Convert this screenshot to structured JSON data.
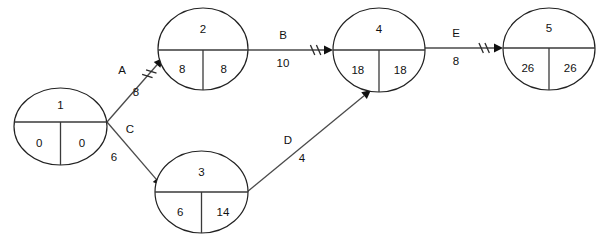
{
  "diagram": {
    "type": "activity-on-arrow-network",
    "title": "",
    "nodes": [
      {
        "id": "1",
        "early": "0",
        "late": "0",
        "cx": 60.5,
        "cy": 126.5,
        "rx": 46.5,
        "ry": 38.5,
        "divider_y": 122
      },
      {
        "id": "2",
        "early": "8",
        "late": "8",
        "cx": 203,
        "cy": 49,
        "rx": 45,
        "ry": 41,
        "divider_y": 50
      },
      {
        "id": "3",
        "early": "6",
        "late": "14",
        "cx": 201.5,
        "cy": 192,
        "rx": 46.5,
        "ry": 41,
        "divider_y": 192
      },
      {
        "id": "4",
        "early": "18",
        "late": "18",
        "cx": 379,
        "cy": 50,
        "rx": 46,
        "ry": 42,
        "divider_y": 50
      },
      {
        "id": "5",
        "early": "26",
        "late": "26",
        "cx": 549,
        "cy": 49,
        "rx": 46,
        "ry": 41,
        "divider_y": 48
      }
    ],
    "edges": [
      {
        "name": "A",
        "duration": "8",
        "from": "1",
        "to": "2",
        "x1": 107,
        "y1": 122,
        "x2": 163,
        "y2": 58,
        "label_x": 122,
        "label_y": 71,
        "dur_x": 136,
        "dur_y": 93,
        "ticks": 2,
        "tick_t": 0.72
      },
      {
        "name": "B",
        "duration": "10",
        "from": "2",
        "to": "4",
        "x1": 248,
        "y1": 50,
        "x2": 333,
        "y2": 50,
        "label_x": 283,
        "label_y": 36,
        "dur_x": 283,
        "dur_y": 64,
        "ticks": 2,
        "tick_t": 0.76
      },
      {
        "name": "C",
        "duration": "6",
        "from": "1",
        "to": "3",
        "x1": 107,
        "y1": 122,
        "x2": 162,
        "y2": 186,
        "label_x": 130,
        "label_y": 130,
        "dur_x": 114,
        "dur_y": 158,
        "ticks": 0,
        "tick_t": 0
      },
      {
        "name": "D",
        "duration": "4",
        "from": "3",
        "to": "4",
        "x1": 247,
        "y1": 192,
        "x2": 371,
        "y2": 90,
        "label_x": 288,
        "label_y": 141,
        "dur_x": 302,
        "dur_y": 159,
        "ticks": 0,
        "tick_t": 0
      },
      {
        "name": "E",
        "duration": "8",
        "from": "4",
        "to": "5",
        "x1": 425,
        "y1": 48,
        "x2": 503,
        "y2": 48,
        "label_x": 456,
        "label_y": 34,
        "dur_x": 456,
        "dur_y": 62,
        "ticks": 2,
        "tick_t": 0.72
      }
    ]
  },
  "colors": {
    "background": "#ffffff",
    "stroke": "#222222",
    "edge": "#4a4a4a",
    "text": "#111111"
  }
}
